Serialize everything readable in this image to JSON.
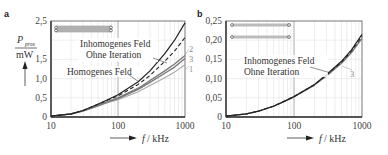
{
  "chart_data": [
    {
      "panel": "a",
      "type": "line",
      "title": "",
      "xlabel": "f / kHz",
      "ylabel": "P_prox / mW",
      "xscale": "log",
      "xlim": [
        10,
        1000
      ],
      "ylim": [
        0,
        2.5
      ],
      "x_ticks": [
        "10",
        "100",
        "1000"
      ],
      "y_ticks": [
        "0",
        "0,5",
        "1,0",
        "1,5",
        "2,5"
      ],
      "grid": true,
      "x": [
        10,
        20,
        30,
        50,
        70,
        100,
        200,
        300,
        500,
        700,
        1000
      ],
      "series": [
        {
          "name": "Inhomogenes Feld",
          "style": "solid-dark",
          "values": [
            0.02,
            0.08,
            0.17,
            0.33,
            0.45,
            0.58,
            0.92,
            1.2,
            1.65,
            2.0,
            2.45
          ]
        },
        {
          "name": "Ohne Iteration",
          "style": "dashed",
          "values": [
            0.02,
            0.08,
            0.17,
            0.33,
            0.44,
            0.55,
            0.85,
            1.08,
            1.45,
            1.72,
            2.07
          ]
        },
        {
          "name": "2",
          "style": "solid-gray",
          "values": [
            0.02,
            0.08,
            0.16,
            0.3,
            0.4,
            0.5,
            0.75,
            0.95,
            1.2,
            1.38,
            1.6
          ]
        },
        {
          "name": "3",
          "style": "solid-gray",
          "values": [
            0.02,
            0.08,
            0.16,
            0.29,
            0.39,
            0.48,
            0.72,
            0.9,
            1.14,
            1.3,
            1.52
          ]
        },
        {
          "name": "Homogenes Feld (1)",
          "style": "solid-light",
          "values": [
            0.02,
            0.07,
            0.15,
            0.28,
            0.37,
            0.45,
            0.66,
            0.82,
            1.02,
            1.17,
            1.36
          ]
        }
      ],
      "annotations": [
        "Inhomogenes Feld",
        "Ohne Iteration",
        "Homogenes Feld",
        "1",
        "2",
        "3"
      ]
    },
    {
      "panel": "b",
      "type": "line",
      "title": "",
      "xlabel": "f / kHz",
      "ylabel": "",
      "xscale": "log",
      "xlim": [
        10,
        1000
      ],
      "ylim": [
        0,
        0.25
      ],
      "x_ticks": [
        "10",
        "100",
        "1000"
      ],
      "y_ticks": [
        "0",
        "0,05",
        "0,10",
        "0,15",
        "0,20",
        "0,25"
      ],
      "grid": true,
      "x": [
        10,
        20,
        30,
        50,
        70,
        100,
        200,
        300,
        500,
        700,
        1000
      ],
      "series": [
        {
          "name": "Inhomogenes Feld",
          "style": "solid-dark",
          "values": [
            0.002,
            0.008,
            0.015,
            0.028,
            0.04,
            0.053,
            0.085,
            0.11,
            0.145,
            0.175,
            0.215
          ]
        },
        {
          "name": "Ohne Iteration",
          "style": "dashed",
          "values": [
            0.002,
            0.008,
            0.015,
            0.028,
            0.04,
            0.053,
            0.084,
            0.109,
            0.143,
            0.172,
            0.21
          ]
        },
        {
          "name": "3",
          "style": "solid-gray",
          "values": [
            0.002,
            0.008,
            0.015,
            0.028,
            0.039,
            0.052,
            0.083,
            0.107,
            0.14,
            0.168,
            0.205
          ]
        }
      ],
      "annotations": [
        "Inhomogenes Feld",
        "Ohne Iteration",
        "3"
      ]
    }
  ],
  "labels": {
    "panel_a": "a",
    "panel_b": "b",
    "ylabel_num": "P",
    "ylabel_sub": "prox",
    "ylabel_unit": "mW",
    "xlabel_f": "f",
    "xlabel_unit": "/ kHz",
    "a_ann_inhom": "Inhomogenes Feld",
    "a_ann_ohne": "Ohne Iteration",
    "a_ann_hom": "Homogenes Feld",
    "a_num1": "1",
    "a_num2": "2",
    "a_num3": "3",
    "b_ann_inhom": "Inhomogenes Feld",
    "b_ann_ohne": "Ohne Iteration",
    "b_num3": "3",
    "a_y": [
      "0",
      "0,5",
      "1,0",
      "1,5",
      "2,5"
    ],
    "b_y": [
      "0",
      "0,05",
      "0,10",
      "0,15",
      "0,20",
      "0,25"
    ],
    "x": [
      "10",
      "100",
      "1000"
    ]
  }
}
